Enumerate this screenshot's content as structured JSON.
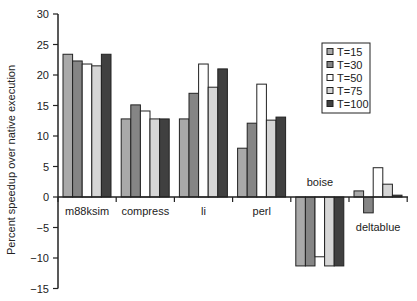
{
  "chart_data": {
    "type": "bar",
    "title": "",
    "xlabel": "",
    "ylabel": "Percent speedup over native execution",
    "ylim": [
      -15,
      30
    ],
    "yticks": [
      30,
      25,
      20,
      15,
      10,
      5,
      0,
      -5,
      -10,
      -15
    ],
    "grid": false,
    "legend_position": "upper right (inside)",
    "categories": [
      "m88ksim",
      "compress",
      "li",
      "perl",
      "boise",
      "deltablue"
    ],
    "series": [
      {
        "name": "T=15",
        "color": "#a9a9a9",
        "values": [
          23.4,
          12.8,
          12.8,
          8.0,
          -11.3,
          1.0
        ]
      },
      {
        "name": "T=30",
        "color": "#858585",
        "values": [
          22.3,
          15.1,
          17.0,
          12.1,
          -11.3,
          -2.6
        ]
      },
      {
        "name": "T=50",
        "color": "#ffffff",
        "values": [
          21.8,
          14.1,
          21.8,
          18.5,
          -9.8,
          4.8
        ]
      },
      {
        "name": "T=75",
        "color": "#d6d6d6",
        "values": [
          21.5,
          12.8,
          18.0,
          12.6,
          -11.3,
          2.1
        ]
      },
      {
        "name": "T=100",
        "color": "#404040",
        "values": [
          23.4,
          12.8,
          21.0,
          13.1,
          -11.3,
          0.3
        ]
      }
    ],
    "category_label_positions": [
      "below",
      "below",
      "below",
      "below",
      "above",
      "below"
    ]
  }
}
